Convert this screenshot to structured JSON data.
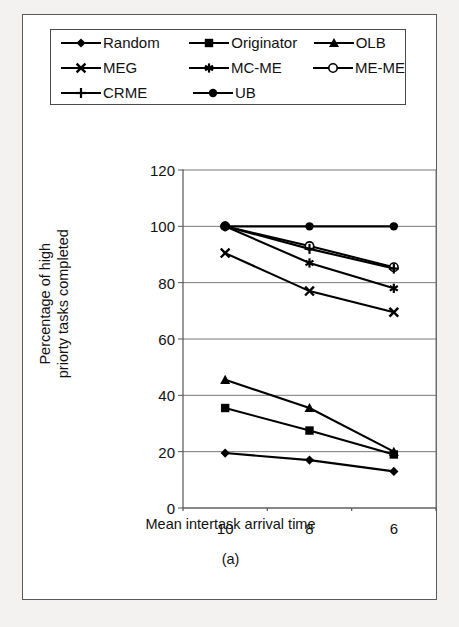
{
  "figure": {
    "caption": "(a)"
  },
  "chart_data": {
    "type": "line",
    "title": "",
    "xlabel": "Mean intertask arrival time",
    "ylabel": "Percentage of high priorty tasks completed",
    "ylabel_line1": "Percentage of high",
    "ylabel_line2": "priorty tasks completed",
    "x": [
      10,
      8,
      6
    ],
    "categories": [
      "10",
      "8",
      "6"
    ],
    "xticklabels": [
      "10",
      "8",
      "6"
    ],
    "yticklabels": [
      "0",
      "20",
      "40",
      "60",
      "80",
      "100",
      "120"
    ],
    "yticks": [
      0,
      20,
      40,
      60,
      80,
      100,
      120
    ],
    "ylim": [
      0,
      120
    ],
    "grid": "horizontal",
    "legend_position": "above-plot",
    "series": [
      {
        "name": "Random",
        "marker": "diamond",
        "values": [
          19.5,
          17,
          13
        ]
      },
      {
        "name": "Originator",
        "marker": "square",
        "values": [
          35.5,
          27.5,
          19
        ]
      },
      {
        "name": "OLB",
        "marker": "triangle",
        "values": [
          45.5,
          35.5,
          20
        ]
      },
      {
        "name": "MEG",
        "marker": "cross-x",
        "values": [
          90.5,
          77,
          69.5
        ]
      },
      {
        "name": "MC-ME",
        "marker": "asterisk",
        "values": [
          100,
          87,
          78
        ]
      },
      {
        "name": "ME-ME",
        "marker": "open-circle",
        "values": [
          100,
          93,
          85.5
        ]
      },
      {
        "name": "CRME",
        "marker": "plus",
        "values": [
          100,
          92,
          85
        ]
      },
      {
        "name": "UB",
        "marker": "filled-circle",
        "values": [
          100,
          100,
          100
        ]
      }
    ]
  },
  "legend": {
    "rows": [
      [
        {
          "label": "Random",
          "marker": "diamond"
        },
        {
          "label": "Originator",
          "marker": "square"
        },
        {
          "label": "OLB",
          "marker": "triangle"
        }
      ],
      [
        {
          "label": "MEG",
          "marker": "cross-x"
        },
        {
          "label": "MC-ME",
          "marker": "asterisk"
        },
        {
          "label": "ME-ME",
          "marker": "open-circle"
        }
      ],
      [
        {
          "label": "CRME",
          "marker": "plus"
        },
        {
          "label": "UB",
          "marker": "filled-circle"
        }
      ]
    ]
  },
  "colors": {
    "line": "#000000",
    "axis": "#555555",
    "grid": "#777777",
    "frame": "#5a5a5a",
    "page_background": "#f3f2f0",
    "plot_background": "#ffffff"
  }
}
